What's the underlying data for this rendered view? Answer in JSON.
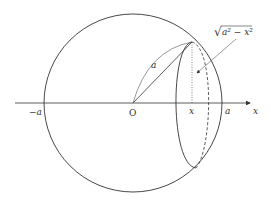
{
  "diagram": {
    "labels": {
      "origin": "O",
      "neg_a": "−a",
      "pos_a": "a",
      "x_tick": "x",
      "x_axis": "x",
      "radius": "a",
      "section_radius": "a² − x²",
      "sqrt_symbol": "√"
    },
    "colors": {
      "stroke": "#333333",
      "background": "#ffffff"
    }
  }
}
